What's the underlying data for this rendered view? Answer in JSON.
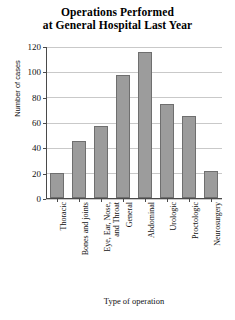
{
  "chart_data": {
    "type": "bar",
    "title": "Operations Performed at General Hospital Last Year",
    "title_lines": [
      "Operations Performed",
      "at General Hospital Last Year"
    ],
    "xlabel": "Type of operation",
    "ylabel": "Number of cases",
    "categories": [
      "Thoracic",
      "Bones and joints",
      "Eye, Ear, Nose, and Throat",
      "General",
      "Abdominal",
      "Urologic",
      "Proctologic",
      "Neurosurgery"
    ],
    "category_lines": [
      [
        "Thoracic"
      ],
      [
        "Bones and joints"
      ],
      [
        "Eye, Ear, Nose,",
        "and Throat"
      ],
      [
        "General"
      ],
      [
        "Abdominal"
      ],
      [
        "Urologic"
      ],
      [
        "Proctologic"
      ],
      [
        "Neurosurgery"
      ]
    ],
    "values": [
      20,
      45,
      57,
      97,
      115,
      74,
      65,
      21
    ],
    "ylim": [
      0,
      120
    ],
    "yticks": [
      0,
      20,
      40,
      60,
      80,
      100,
      120
    ],
    "ytick_labels": [
      "0",
      "20",
      "40",
      "60",
      "80",
      "100",
      "120"
    ],
    "grid": true,
    "legend": false,
    "bar_color": "#9c9c9c",
    "bar_edge_color": "#6f6f6f",
    "grid_color": "#c9c9c9",
    "axis_color": "#4a4a4a"
  }
}
